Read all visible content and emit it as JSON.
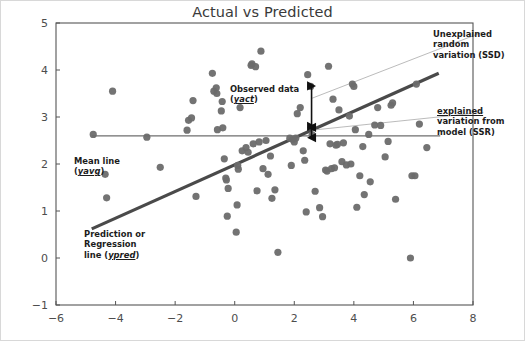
{
  "chart_data": {
    "type": "scatter",
    "title": "Actual vs Predicted",
    "xlabel": "",
    "ylabel": "",
    "xlim": [
      -6,
      8
    ],
    "ylim": [
      -1,
      5
    ],
    "xticks": [
      -6,
      -4,
      -2,
      0,
      2,
      4,
      6,
      8
    ],
    "yticks": [
      -1,
      0,
      1,
      2,
      3,
      4,
      5
    ],
    "grid": false,
    "legend": "none",
    "series": [
      {
        "name": "Observed data",
        "marker": "circle",
        "color": "#6b6b6b",
        "points": [
          [
            -4.75,
            2.63
          ],
          [
            -4.35,
            1.78
          ],
          [
            -4.3,
            1.28
          ],
          [
            -4.1,
            3.55
          ],
          [
            -2.95,
            2.57
          ],
          [
            -2.5,
            1.93
          ],
          [
            -1.6,
            2.72
          ],
          [
            -1.55,
            2.93
          ],
          [
            -1.45,
            2.98
          ],
          [
            -1.4,
            3.35
          ],
          [
            -1.3,
            1.31
          ],
          [
            -0.75,
            3.93
          ],
          [
            -0.7,
            3.55
          ],
          [
            -0.62,
            3.62
          ],
          [
            -0.6,
            3.5
          ],
          [
            -0.58,
            2.73
          ],
          [
            -0.45,
            3.13
          ],
          [
            -0.42,
            3.33
          ],
          [
            -0.4,
            2.77
          ],
          [
            -0.35,
            2.11
          ],
          [
            -0.3,
            1.7
          ],
          [
            -0.28,
            1.66
          ],
          [
            -0.25,
            0.89
          ],
          [
            -0.22,
            1.48
          ],
          [
            0.05,
            0.55
          ],
          [
            0.08,
            1.13
          ],
          [
            0.1,
            1.97
          ],
          [
            0.12,
            1.89
          ],
          [
            0.18,
            3.2
          ],
          [
            0.25,
            2.28
          ],
          [
            0.38,
            2.35
          ],
          [
            0.45,
            2.25
          ],
          [
            0.55,
            4.1
          ],
          [
            0.58,
            4.13
          ],
          [
            0.62,
            2.43
          ],
          [
            0.7,
            4.07
          ],
          [
            0.75,
            1.43
          ],
          [
            0.82,
            2.47
          ],
          [
            0.88,
            4.4
          ],
          [
            0.95,
            1.9
          ],
          [
            1.05,
            2.5
          ],
          [
            1.12,
            1.78
          ],
          [
            1.2,
            2.17
          ],
          [
            1.25,
            1.27
          ],
          [
            1.35,
            1.45
          ],
          [
            1.45,
            0.12
          ],
          [
            1.85,
            2.55
          ],
          [
            1.9,
            1.97
          ],
          [
            1.95,
            2.52
          ],
          [
            2.0,
            2.47
          ],
          [
            2.05,
            2.55
          ],
          [
            2.1,
            3.07
          ],
          [
            2.2,
            3.2
          ],
          [
            2.3,
            2.28
          ],
          [
            2.35,
            2.08
          ],
          [
            2.4,
            0.98
          ],
          [
            2.45,
            3.9
          ],
          [
            2.55,
            3.65
          ],
          [
            2.6,
            2.62
          ],
          [
            2.7,
            1.42
          ],
          [
            2.85,
            1.07
          ],
          [
            2.95,
            0.88
          ],
          [
            3.05,
            1.87
          ],
          [
            3.1,
            1.85
          ],
          [
            3.15,
            4.08
          ],
          [
            3.2,
            2.43
          ],
          [
            3.25,
            1.9
          ],
          [
            3.3,
            3.38
          ],
          [
            3.35,
            1.92
          ],
          [
            3.4,
            2.4
          ],
          [
            3.45,
            2.42
          ],
          [
            3.5,
            3.15
          ],
          [
            3.6,
            2.05
          ],
          [
            3.65,
            2.45
          ],
          [
            3.75,
            1.98
          ],
          [
            3.85,
            3.02
          ],
          [
            3.9,
            2.0
          ],
          [
            3.95,
            3.7
          ],
          [
            4.0,
            3.65
          ],
          [
            4.05,
            2.73
          ],
          [
            4.1,
            1.08
          ],
          [
            4.2,
            1.75
          ],
          [
            4.3,
            2.37
          ],
          [
            4.35,
            1.35
          ],
          [
            4.5,
            2.63
          ],
          [
            4.55,
            1.62
          ],
          [
            4.7,
            2.83
          ],
          [
            4.8,
            3.2
          ],
          [
            4.9,
            2.82
          ],
          [
            5.05,
            2.15
          ],
          [
            5.15,
            2.48
          ],
          [
            5.25,
            3.25
          ],
          [
            5.3,
            3.3
          ],
          [
            5.4,
            1.25
          ],
          [
            5.9,
            0.0
          ],
          [
            5.95,
            1.75
          ],
          [
            6.05,
            1.75
          ],
          [
            6.1,
            3.7
          ],
          [
            6.2,
            2.85
          ],
          [
            6.45,
            2.35
          ]
        ]
      }
    ],
    "reference_lines": [
      {
        "name": "Mean line",
        "type": "horizontal",
        "y": 2.6,
        "x_start": -4.8,
        "x_end": 6.9,
        "color": "#6e6e6e",
        "width": 1.2
      },
      {
        "name": "Prediction or Regression line",
        "type": "linear",
        "x_start": -4.8,
        "y_start": 0.62,
        "x_end": 6.85,
        "y_end": 3.93,
        "color": "#4a4a4a",
        "width": 3.2
      },
      {
        "name": "Unexplained random variation leader",
        "type": "leader",
        "x_start": 2.6,
        "y_start": 3.4,
        "x_end": 8.3,
        "y_end": 4.8,
        "color": "#a9a9a9",
        "width": 0.8
      },
      {
        "name": "Explained variation leader",
        "type": "leader",
        "x_start": 2.6,
        "y_start": 2.72,
        "x_end": 8.35,
        "y_end": 3.1,
        "color": "#a9a9a9",
        "width": 0.8
      }
    ],
    "annotation_arrows": [
      {
        "name": "ssd-arrow",
        "x": 2.58,
        "y_top": 3.66,
        "y_bottom": 2.78,
        "double_headed": true,
        "color": "#101010"
      },
      {
        "name": "ssr-arrow",
        "x": 2.58,
        "y_top": 2.8,
        "y_bottom": 2.56,
        "double_headed": true,
        "color": "#101010"
      }
    ],
    "annotations": [
      {
        "name": "unexplained-variation-label",
        "lines": [
          "Unexplained",
          "random",
          "variation (SSD)"
        ]
      },
      {
        "name": "explained-variation-label",
        "lines": [
          "explained",
          "variation from",
          "model (SSR)"
        ]
      },
      {
        "name": "observed-data-label",
        "line1": "Observed data",
        "line2_prefix": "(",
        "line2_var": "yact",
        "line2_suffix": ")"
      },
      {
        "name": "mean-line-label",
        "line1": "Mean line",
        "line2_prefix": "(",
        "line2_var": "yavg",
        "line2_suffix": ")"
      },
      {
        "name": "prediction-line-label",
        "line1": "Prediction or",
        "line2": "Regression",
        "line3_prefix": "line (",
        "line3_var": "ypred",
        "line3_suffix": ")"
      }
    ]
  },
  "colors": {
    "point": "#6b6b6b",
    "regression_line": "#4a4a4a",
    "mean_line": "#6e6e6e",
    "leader_line": "#a9a9a9",
    "arrow": "#101010",
    "axis": "#555555",
    "tick_text": "#4d4d4d",
    "title_text": "#3a3a3a",
    "outer_border": "#d8d8d8",
    "background": "#ffffff"
  }
}
